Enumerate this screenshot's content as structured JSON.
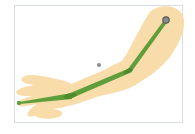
{
  "diagram": {
    "type": "arm-skeleton-rig",
    "colors": {
      "skin": "#f8dcaa",
      "bone": "#5f9e3a",
      "bone_dark": "#4e8a2e",
      "joint": "#6b7d4a",
      "shoulder_joint_fill": "#8a8a8a",
      "shoulder_joint_stroke": "#5a5a5a",
      "pivot": "#8c8c8c",
      "frame_border": "#d6dde3",
      "background": "#ffffff"
    },
    "joints": [
      {
        "name": "shoulder",
        "x": 166,
        "y": 20
      },
      {
        "name": "elbow",
        "x": 130,
        "y": 70
      },
      {
        "name": "wrist",
        "x": 70,
        "y": 96
      },
      {
        "name": "fingertip",
        "x": 19,
        "y": 103
      }
    ],
    "pivot": {
      "name": "center-pivot",
      "x": 99,
      "y": 65
    },
    "bones": [
      {
        "name": "upper-arm",
        "from": "shoulder",
        "to": "elbow"
      },
      {
        "name": "forearm",
        "from": "elbow",
        "to": "wrist"
      },
      {
        "name": "hand",
        "from": "wrist",
        "to": "fingertip"
      }
    ]
  }
}
